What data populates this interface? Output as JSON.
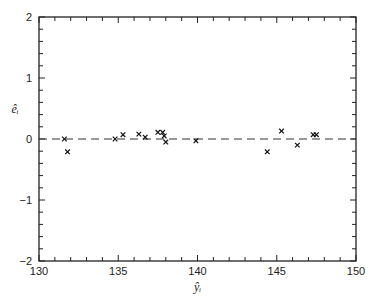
{
  "chart_data": {
    "type": "scatter",
    "title": "",
    "xlabel": "ŷᵢ",
    "ylabel": "êᵢ",
    "xlim": [
      130,
      150
    ],
    "ylim": [
      -2,
      2
    ],
    "xticks": [
      130,
      135,
      140,
      145,
      150
    ],
    "yticks": [
      -2,
      -1,
      0,
      1,
      2
    ],
    "x_minor_step": 1,
    "y_minor_step": 0.2,
    "grid": false,
    "reference_line": {
      "y": 0,
      "style": "dashed"
    },
    "marker": "x",
    "series": [
      {
        "name": "residuals",
        "points": [
          {
            "x": 131.6,
            "y": 0.0
          },
          {
            "x": 131.8,
            "y": -0.21
          },
          {
            "x": 134.8,
            "y": 0.0
          },
          {
            "x": 135.3,
            "y": 0.07
          },
          {
            "x": 136.3,
            "y": 0.08
          },
          {
            "x": 136.7,
            "y": 0.03
          },
          {
            "x": 137.5,
            "y": 0.11
          },
          {
            "x": 137.8,
            "y": 0.11
          },
          {
            "x": 137.9,
            "y": 0.05
          },
          {
            "x": 138.0,
            "y": -0.05
          },
          {
            "x": 139.9,
            "y": -0.03
          },
          {
            "x": 144.4,
            "y": -0.21
          },
          {
            "x": 145.3,
            "y": 0.13
          },
          {
            "x": 146.3,
            "y": -0.1
          },
          {
            "x": 147.3,
            "y": 0.07
          },
          {
            "x": 147.5,
            "y": 0.07
          }
        ]
      }
    ]
  }
}
